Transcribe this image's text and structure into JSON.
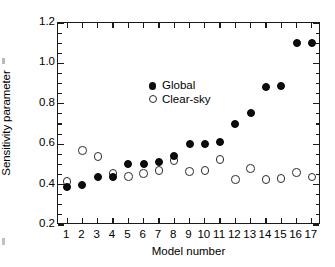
{
  "chart_data": {
    "type": "scatter",
    "title": "",
    "xlabel": "Model number",
    "ylabel": "Sensitivity parameter",
    "xlim": [
      0.4,
      17.6
    ],
    "ylim": [
      0.2,
      1.2
    ],
    "yticks": [
      0.2,
      0.4,
      0.6,
      0.8,
      1.0,
      1.2
    ],
    "ytick_labels": [
      "0.2",
      "0.4",
      "0.6",
      "0.8",
      "1.0",
      "1.2"
    ],
    "yminor_step": 0.05,
    "grid": false,
    "legend_position": "upper left",
    "categories": [
      1,
      2,
      3,
      4,
      5,
      6,
      7,
      8,
      9,
      10,
      11,
      12,
      13,
      14,
      15,
      16,
      17
    ],
    "xtick_labels": [
      "1",
      "2",
      "3",
      "4",
      "5",
      "6",
      "7",
      "8",
      "9",
      "10",
      "11",
      "12",
      "13",
      "14",
      "15",
      "16",
      "17"
    ],
    "series": [
      {
        "name": "Global",
        "marker": "filled-circle",
        "color": "#0d0d0d",
        "values": [
          0.39,
          0.4,
          0.44,
          0.44,
          0.5,
          0.5,
          0.51,
          0.54,
          0.6,
          0.6,
          0.61,
          0.7,
          0.755,
          0.885,
          0.89,
          1.1,
          1.1
        ]
      },
      {
        "name": "Clear-sky",
        "marker": "open-circle",
        "color": "#ffffff",
        "values": [
          0.415,
          0.57,
          0.54,
          0.455,
          0.44,
          0.455,
          0.47,
          0.52,
          0.465,
          0.47,
          0.525,
          0.425,
          0.48,
          0.425,
          0.43,
          0.46,
          0.437
        ]
      }
    ]
  },
  "legend": {
    "entries": [
      {
        "label": "Global",
        "marker": "filled-circle"
      },
      {
        "label": "Clear-sky",
        "marker": "open-circle"
      }
    ]
  }
}
